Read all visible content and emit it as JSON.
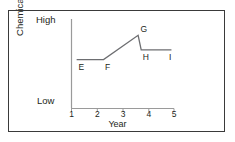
{
  "chart_data": {
    "type": "line",
    "title": "",
    "xlabel": "Year",
    "ylabel": "Chemical level",
    "xlim": [
      1,
      5
    ],
    "ylim": [
      0,
      1
    ],
    "grid": false,
    "legend": null,
    "x_ticks": [
      "1",
      "2",
      "3",
      "4",
      "5"
    ],
    "x_tick_values": [
      1,
      2,
      3,
      4,
      5
    ],
    "y_ticks": [
      "Low",
      "High"
    ],
    "y_tick_values": [
      0.06,
      0.92
    ],
    "series": [
      {
        "name": "chemical-level",
        "x": [
          1.2,
          2.25,
          3.6,
          3.72,
          4.9
        ],
        "y": [
          0.56,
          0.56,
          0.86,
          0.68,
          0.68
        ]
      }
    ],
    "annotations": [
      {
        "label": "E",
        "x": 1.22,
        "y": 0.56,
        "placement": "below-right"
      },
      {
        "label": "F",
        "x": 2.25,
        "y": 0.56,
        "placement": "below-right"
      },
      {
        "label": "G",
        "x": 3.62,
        "y": 0.86,
        "placement": "above-right"
      },
      {
        "label": "H",
        "x": 3.72,
        "y": 0.68,
        "placement": "below-right"
      },
      {
        "label": "I",
        "x": 4.82,
        "y": 0.68,
        "placement": "below-left"
      }
    ],
    "colors": {
      "line": "#6d6e71",
      "axis": "#9a9a9a",
      "text": "#231f20",
      "frame": "#3a3a3a",
      "background": "#ffffff"
    }
  },
  "axis": {
    "y_label": "Chemical level",
    "y_high_label": "High",
    "y_low_label": "Low",
    "x_label": "Year"
  },
  "x_ticks": [
    {
      "label": "1"
    },
    {
      "label": "2"
    },
    {
      "label": "3"
    },
    {
      "label": "4"
    },
    {
      "label": "5"
    }
  ],
  "points": [
    {
      "label": "E"
    },
    {
      "label": "F"
    },
    {
      "label": "G"
    },
    {
      "label": "H"
    },
    {
      "label": "I"
    }
  ]
}
